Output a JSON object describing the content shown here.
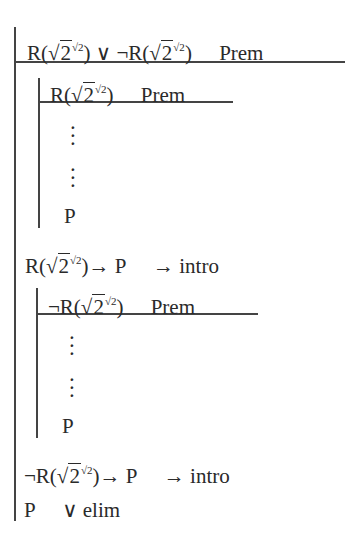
{
  "proof": {
    "outer": {
      "premise": {
        "formula": "R(√2^√2) ∨ ¬R(√2^√2)",
        "justification": "Prem"
      }
    },
    "sub1": {
      "premise": {
        "formula": "R(√2^√2)",
        "justification": "Prem"
      },
      "dots": [
        "⋮",
        "⋮"
      ],
      "conclusion": "P"
    },
    "step1": {
      "formula": "R(√2^√2)→ P",
      "justification": "→ intro"
    },
    "sub2": {
      "premise": {
        "formula": "¬R(√2^√2)",
        "justification": "Prem"
      },
      "dots": [
        "⋮",
        "⋮"
      ],
      "conclusion": "P"
    },
    "step2": {
      "formula": "¬R(√2^√2)→ P",
      "justification": "→ intro"
    },
    "final": {
      "formula": "P",
      "justification": "∨ elim"
    }
  },
  "parts": {
    "R": "R(",
    "close": ")",
    "two": "2",
    "root": "√",
    "or": "∨",
    "neg": "¬",
    "arrow": "→ P",
    "P": "P"
  }
}
